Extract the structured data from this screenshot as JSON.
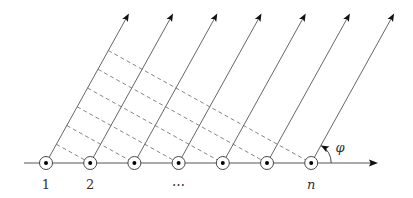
{
  "diagram": {
    "source_count": 7,
    "angle_label": "φ",
    "angle_degrees": 61,
    "labels": [
      {
        "index": 0,
        "text": "1",
        "style": "roman"
      },
      {
        "index": 1,
        "text": "2",
        "style": "roman"
      },
      {
        "index": 3,
        "text": "⋯",
        "style": "roman"
      },
      {
        "index": 6,
        "text": "n",
        "style": "italic"
      }
    ],
    "elements": {
      "source_symbol": "circled-dot-icon",
      "ray_style": "solid-arrow",
      "wavefront_style": "dashed"
    }
  }
}
